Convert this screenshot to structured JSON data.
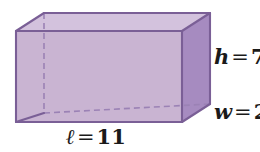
{
  "figure": {
    "name": "rectangular-prism",
    "type": "3d-rectangular-prism-diagram",
    "background_color": "#ffffff"
  },
  "labels": {
    "height": {
      "variable": "h",
      "equals": "=",
      "value": "7",
      "full": "h = 7",
      "clipped": true
    },
    "width": {
      "variable": "w",
      "equals": "=",
      "value": "2",
      "full": "w = 2",
      "clipped": true
    },
    "length": {
      "variable": "ℓ",
      "equals": "=",
      "value": "11",
      "full": "ℓ = 11",
      "clipped": false
    }
  },
  "colors": {
    "front_face": "#c9b4d2",
    "top_face": "#d3c2dd",
    "right_face": "#a68bc0",
    "bottom_face": "#b096c4",
    "edge_stroke": "#7a5f96",
    "hidden_edge_stroke": "#9b82b5",
    "text": "#1a1a1a"
  },
  "geometry": {
    "front_face_points": "16,31 182,31 182,122 16,122",
    "top_face_points": "16,31 44,13 210,13 182,31",
    "right_face_points": "182,31 210,13 210,104 182,122",
    "bottom_face_points": "16,122 182,122 210,104 44,113",
    "hidden_vertical_edge": "44,13 44,113",
    "hidden_bottom_edge": "44,113 210,104",
    "visible_edges": [
      "16,31 182,31",
      "16,31 16,122",
      "182,31 182,122",
      "16,122 182,122",
      "16,31 44,13",
      "44,13 210,13",
      "210,13 182,31",
      "182,122 210,104",
      "210,13 210,104",
      "16,122 44,113"
    ]
  }
}
